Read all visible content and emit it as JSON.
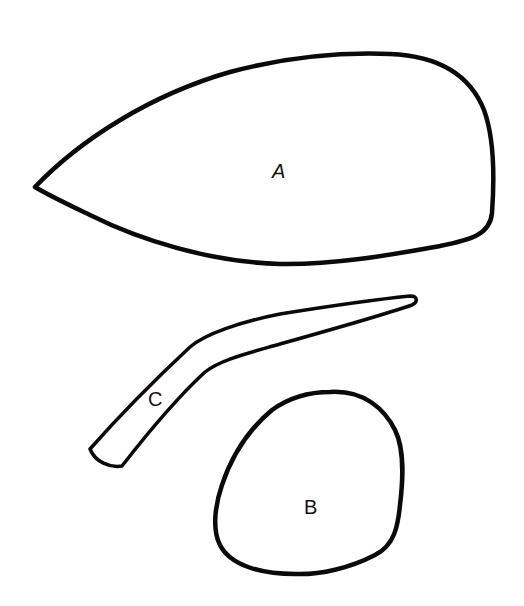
{
  "diagram": {
    "stroke_color": "#0a0a0a",
    "background_color": "#ffffff",
    "shapes": [
      {
        "id": "A",
        "label": "A",
        "form": "teardrop / leaf outline pointing left"
      },
      {
        "id": "B",
        "label": "B",
        "form": "rounded irregular blob"
      },
      {
        "id": "C",
        "label": "C",
        "form": "bent elongated tapered strip"
      }
    ]
  }
}
